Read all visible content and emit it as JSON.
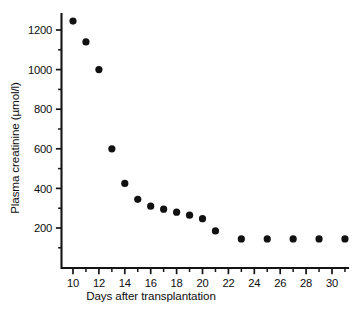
{
  "chart_data": {
    "type": "scatter",
    "title": "",
    "xlabel": "Days after transplantation",
    "ylabel": "Plasma creatinine (µmol/l)",
    "xlim": [
      8.6,
      32.2
    ],
    "ylim": [
      60,
      1320
    ],
    "grid": false,
    "legend": false,
    "marker": {
      "shape": "circle",
      "color": "#111111",
      "size_px": 3.6
    },
    "x_ticks_major": [
      10,
      12,
      14,
      16,
      18,
      20,
      22,
      24,
      26,
      28,
      30
    ],
    "x_tick_labels": [
      "10",
      "12",
      "14",
      "16",
      "18",
      "20",
      "22",
      "24",
      "26",
      "28",
      "30"
    ],
    "x_ticks_minor": [
      11,
      13,
      15,
      17,
      19,
      21,
      23,
      25,
      27,
      29,
      31
    ],
    "y_ticks_major": [
      200,
      400,
      600,
      800,
      1000,
      1200
    ],
    "y_tick_labels": [
      "200",
      "400",
      "600",
      "800",
      "1000",
      "1200"
    ],
    "y_ticks_minor": [
      100,
      300,
      500,
      700,
      900,
      1100
    ],
    "series": [
      {
        "name": "Plasma creatinine",
        "x": [
          10,
          11,
          12,
          13,
          14,
          15,
          16,
          17,
          18,
          19,
          20,
          21,
          23,
          25,
          27,
          29,
          31
        ],
        "values": [
          1245,
          1140,
          1000,
          600,
          425,
          345,
          310,
          295,
          280,
          265,
          247,
          185,
          145,
          145,
          145,
          145,
          145
        ]
      }
    ]
  }
}
